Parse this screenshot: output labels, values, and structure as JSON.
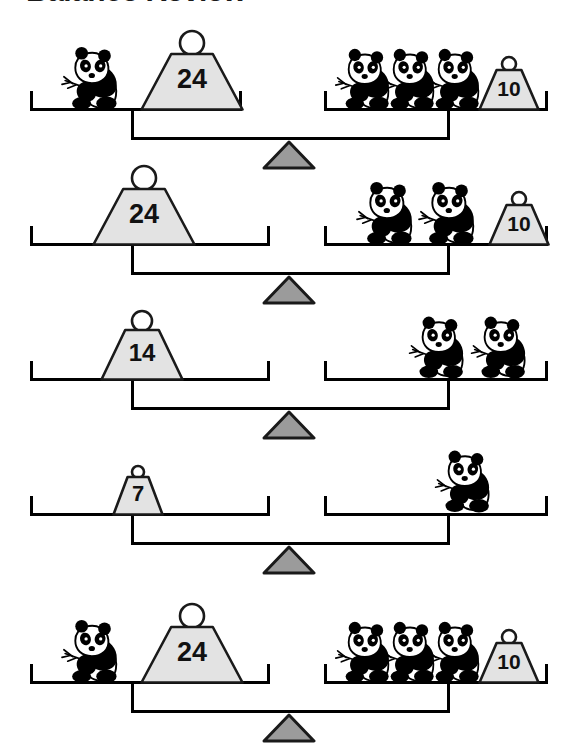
{
  "title": "Balance Review",
  "colors": {
    "ink": "#000000",
    "weight_fill": "#e3e3e3",
    "weight_stroke": "#1a1a1a",
    "fulcrum_fill": "#9b9b9b",
    "fulcrum_stroke": "#1a1a1a",
    "panda_black": "#000000",
    "panda_white": "#ffffff",
    "page_background": "#ffffff"
  },
  "chart_data": {
    "type": "table",
    "title": "Balance Review",
    "unit_item": "panda",
    "rows": [
      {
        "row": 1,
        "left": {
          "pandas": 1,
          "weights": [
            24
          ]
        },
        "right": {
          "pandas": 3,
          "weights": [
            10
          ]
        },
        "balanced": true
      },
      {
        "row": 2,
        "left": {
          "pandas": 0,
          "weights": [
            24
          ]
        },
        "right": {
          "pandas": 2,
          "weights": [
            10
          ]
        },
        "balanced": true
      },
      {
        "row": 3,
        "left": {
          "pandas": 0,
          "weights": [
            14
          ]
        },
        "right": {
          "pandas": 2,
          "weights": []
        },
        "balanced": true
      },
      {
        "row": 4,
        "left": {
          "pandas": 0,
          "weights": [
            7
          ]
        },
        "right": {
          "pandas": 1,
          "weights": []
        },
        "balanced": true
      },
      {
        "row": 5,
        "left": {
          "pandas": 1,
          "weights": [
            24
          ]
        },
        "right": {
          "pandas": 3,
          "weights": [
            10
          ]
        },
        "balanced": true
      }
    ]
  },
  "rows": [
    {
      "id": "balance-1",
      "top": 30,
      "left_pan": {
        "x": 30,
        "y": 108,
        "w": 212
      },
      "right_pan": {
        "x": 324,
        "y": 108,
        "w": 224
      },
      "beam": {
        "x": 131,
        "y": 137,
        "w": 316
      },
      "fulcrum": {
        "cx": 289,
        "y": 140
      },
      "left_items": [
        {
          "kind": "panda",
          "x": 55,
          "w": 66,
          "h": 66
        },
        {
          "kind": "weight",
          "x": 140,
          "w": 104,
          "h": 82,
          "value": "24",
          "font": 27
        }
      ],
      "right_items": [
        {
          "kind": "panda",
          "x": 330,
          "w": 62,
          "h": 64
        },
        {
          "kind": "panda",
          "x": 375,
          "w": 62,
          "h": 64
        },
        {
          "kind": "panda",
          "x": 420,
          "w": 62,
          "h": 64
        },
        {
          "kind": "weight",
          "x": 478,
          "w": 62,
          "h": 56,
          "value": "10",
          "font": 21
        }
      ]
    },
    {
      "id": "balance-2",
      "top": 165,
      "left_pan": {
        "x": 30,
        "y": 243,
        "w": 240
      },
      "right_pan": {
        "x": 324,
        "y": 243,
        "w": 224
      },
      "beam": {
        "x": 131,
        "y": 272,
        "w": 316
      },
      "fulcrum": {
        "cx": 289,
        "y": 275
      },
      "left_items": [
        {
          "kind": "weight",
          "x": 92,
          "w": 104,
          "h": 82,
          "value": "24",
          "font": 27
        }
      ],
      "right_items": [
        {
          "kind": "panda",
          "x": 350,
          "w": 66,
          "h": 66
        },
        {
          "kind": "panda",
          "x": 412,
          "w": 66,
          "h": 66
        },
        {
          "kind": "weight",
          "x": 488,
          "w": 62,
          "h": 56,
          "value": "10",
          "font": 21
        }
      ]
    },
    {
      "id": "balance-3",
      "top": 300,
      "left_pan": {
        "x": 30,
        "y": 378,
        "w": 240
      },
      "right_pan": {
        "x": 324,
        "y": 378,
        "w": 224
      },
      "beam": {
        "x": 131,
        "y": 407,
        "w": 316
      },
      "fulcrum": {
        "cx": 289,
        "y": 410
      },
      "left_items": [
        {
          "kind": "weight",
          "x": 100,
          "w": 84,
          "h": 72,
          "value": "14",
          "font": 24
        }
      ],
      "right_items": [
        {
          "kind": "panda",
          "x": 404,
          "w": 62,
          "h": 68
        },
        {
          "kind": "panda",
          "x": 466,
          "w": 62,
          "h": 68
        }
      ]
    },
    {
      "id": "balance-4",
      "top": 435,
      "left_pan": {
        "x": 30,
        "y": 513,
        "w": 240
      },
      "right_pan": {
        "x": 324,
        "y": 513,
        "w": 224
      },
      "beam": {
        "x": 131,
        "y": 542,
        "w": 316
      },
      "fulcrum": {
        "cx": 289,
        "y": 545
      },
      "left_items": [
        {
          "kind": "weight",
          "x": 112,
          "w": 52,
          "h": 52,
          "value": "7",
          "font": 22
        }
      ],
      "right_items": [
        {
          "kind": "panda",
          "x": 430,
          "w": 62,
          "h": 70
        }
      ]
    },
    {
      "id": "balance-5",
      "top": 573,
      "left_pan": {
        "x": 30,
        "y": 681,
        "w": 240
      },
      "right_pan": {
        "x": 324,
        "y": 681,
        "w": 224
      },
      "beam": {
        "x": 131,
        "y": 710,
        "w": 316
      },
      "fulcrum": {
        "cx": 289,
        "y": 713
      },
      "left_items": [
        {
          "kind": "panda",
          "x": 55,
          "w": 66,
          "h": 66
        },
        {
          "kind": "weight",
          "x": 140,
          "w": 104,
          "h": 82,
          "value": "24",
          "font": 27
        }
      ],
      "right_items": [
        {
          "kind": "panda",
          "x": 330,
          "w": 62,
          "h": 64
        },
        {
          "kind": "panda",
          "x": 375,
          "w": 62,
          "h": 64
        },
        {
          "kind": "panda",
          "x": 420,
          "w": 62,
          "h": 64
        },
        {
          "kind": "weight",
          "x": 478,
          "w": 62,
          "h": 56,
          "value": "10",
          "font": 21
        }
      ]
    }
  ]
}
